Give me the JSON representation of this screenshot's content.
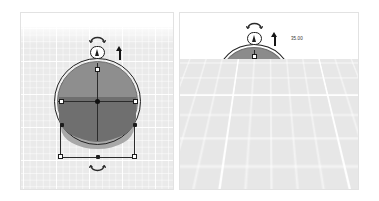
{
  "app": {
    "title": "3D CAD Workplane Editor",
    "view_count": 2
  },
  "panels": [
    {
      "id": "left",
      "name": "top-view-panel",
      "view_label": "Top orthographic view",
      "object": {
        "type": "cylinder",
        "selected": true,
        "fill_color": "#8e8e8e",
        "outline_color": "#222222",
        "shadow_color": "#6f6f6f"
      },
      "handles": {
        "square_count": 6,
        "dot_count": 3,
        "center_marker": true,
        "extrude_handle_icon": "cone-icon",
        "move_arrow_icon": "up-arrow-icon",
        "rotate_top_icon": "rotate-arc-icon",
        "rotate_bottom_icon": "rotate-arc-icon"
      },
      "dimensions": []
    },
    {
      "id": "right",
      "name": "perspective-view-panel",
      "view_label": "Perspective view",
      "object": {
        "type": "cylinder",
        "selected": true,
        "fill_color": "#8e8e8e",
        "outline_color": "#222222",
        "shadow_color": "#6f6f6f"
      },
      "handles": {
        "square_count": 6,
        "dot_count": 4,
        "center_marker": true,
        "extrude_handle_icon": "cone-icon",
        "move_arrow_icon": "up-arrow-icon",
        "rotate_top_icon": "rotate-arc-icon"
      },
      "dimensions": [
        {
          "id": "height-top",
          "value": "35.00",
          "placement": "top-right"
        },
        {
          "id": "height-side",
          "value": "20.00",
          "placement": "right-middle",
          "boxed": true
        }
      ]
    }
  ],
  "colors": {
    "panel_background": "#ffffff",
    "panel_border": "#e2e2e2",
    "workplane_fill": "#e9e9e9",
    "grid_line": "#ffffff",
    "solid_light": "#a8a8a8",
    "solid_mid": "#8e8e8e",
    "solid_dark": "#6f6f6f",
    "handle_stroke": "#1c1c1c",
    "handle_fill": "#ffffff"
  }
}
